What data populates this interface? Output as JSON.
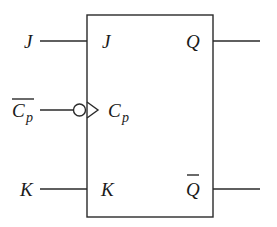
{
  "diagram": {
    "type": "JK flip-flop symbol",
    "block": {
      "inputs": [
        {
          "external_label": "J",
          "internal_label": "J"
        },
        {
          "external_label": "C",
          "external_subscript": "p",
          "external_overbar": true,
          "internal_label": "C",
          "internal_subscript": "p",
          "negated_clock": true
        },
        {
          "external_label": "K",
          "internal_label": "K"
        }
      ],
      "outputs": [
        {
          "internal_label": "Q",
          "overbar": false
        },
        {
          "internal_label": "Q",
          "overbar": true
        }
      ]
    },
    "colors": {
      "stroke": "#2a2a2a",
      "text": "#1a1a1a",
      "background": "#ffffff"
    }
  }
}
